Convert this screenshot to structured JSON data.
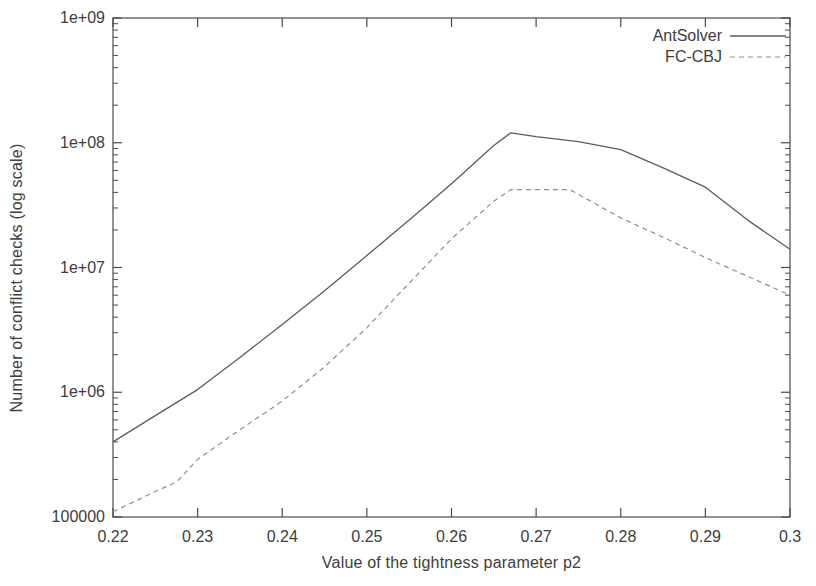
{
  "figure": {
    "background": "#ffffff",
    "axis_color": "#4a4a4a",
    "text_color": "#3d3d3d"
  },
  "chart_data": {
    "type": "line",
    "title": "",
    "xlabel": "Value of the tightness parameter p2",
    "ylabel": "Number of conflict checks (log scale)",
    "xlim": [
      0.22,
      0.3
    ],
    "ylim": [
      100000,
      1000000000
    ],
    "y_scale": "log",
    "grid": false,
    "legend_position": "top-right-inside",
    "x_ticks": {
      "values": [
        0.22,
        0.23,
        0.24,
        0.25,
        0.26,
        0.27,
        0.28,
        0.29,
        0.3
      ],
      "labels": [
        "0.22",
        "0.23",
        "0.24",
        "0.25",
        "0.26",
        "0.27",
        "0.28",
        "0.29",
        "0.3"
      ]
    },
    "y_ticks": {
      "values": [
        100000,
        1000000,
        10000000,
        100000000,
        1000000000
      ],
      "labels": [
        "100000",
        "1e+06",
        "1e+07",
        "1e+08",
        "1e+09"
      ]
    },
    "series": [
      {
        "name": "AntSolver",
        "style": "solid",
        "color": "#5c5c5c",
        "points": [
          [
            0.22,
            400000
          ],
          [
            0.225,
            650000
          ],
          [
            0.23,
            1050000
          ],
          [
            0.235,
            1900000
          ],
          [
            0.24,
            3500000
          ],
          [
            0.245,
            6500000
          ],
          [
            0.25,
            12500000
          ],
          [
            0.255,
            24000000
          ],
          [
            0.26,
            47000000
          ],
          [
            0.265,
            95000000
          ],
          [
            0.267,
            120000000
          ],
          [
            0.27,
            112000000
          ],
          [
            0.275,
            102000000
          ],
          [
            0.28,
            88000000
          ],
          [
            0.285,
            63000000
          ],
          [
            0.29,
            44000000
          ],
          [
            0.295,
            24000000
          ],
          [
            0.3,
            14000000
          ]
        ]
      },
      {
        "name": "FC-CBJ",
        "style": "dashed",
        "color": "#8f8f8f",
        "points": [
          [
            0.22,
            110000
          ],
          [
            0.225,
            160000
          ],
          [
            0.2275,
            190000
          ],
          [
            0.23,
            290000
          ],
          [
            0.235,
            500000
          ],
          [
            0.24,
            850000
          ],
          [
            0.245,
            1600000
          ],
          [
            0.25,
            3300000
          ],
          [
            0.255,
            7500000
          ],
          [
            0.26,
            17000000
          ],
          [
            0.265,
            34000000
          ],
          [
            0.267,
            42000000
          ],
          [
            0.274,
            42000000
          ],
          [
            0.28,
            25000000
          ],
          [
            0.285,
            17500000
          ],
          [
            0.29,
            12000000
          ],
          [
            0.295,
            8500000
          ],
          [
            0.3,
            6000000
          ]
        ]
      }
    ]
  }
}
